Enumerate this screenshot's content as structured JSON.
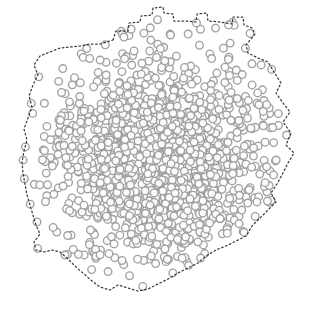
{
  "figure": {
    "title": "",
    "width": 315,
    "height": 314,
    "background_color": "#ffffff",
    "alt_text": "Dense cloud of small gray-outlined circle markers enclosed by a dark dashed jagged boundary outline"
  },
  "chart_data": {
    "type": "scatter",
    "title": "",
    "subtitle": "",
    "xlabel": "",
    "ylabel": "",
    "xlim": [
      0,
      315
    ],
    "ylim": [
      0,
      314
    ],
    "grid": false,
    "legend": null,
    "axes_visible": false,
    "tick_labels_x": [],
    "tick_labels_y": [],
    "annotations": [],
    "series": [
      {
        "name": "points",
        "marker": "circle-open",
        "marker_size_px": 7.6,
        "marker_edge_color": "#9c9c9c",
        "marker_edge_width_px": 1.35,
        "marker_face_color": "#fdfdfd",
        "marker_opacity": 0.95,
        "point_count": 1340,
        "distribution": "gaussian-radial",
        "center_x": 160,
        "center_y": 158,
        "sigma_x": 56,
        "sigma_y": 54,
        "random_seed": 20240517
      }
    ],
    "boundary": {
      "name": "concave-hull",
      "style": "dotted",
      "color": "#3b3b3b",
      "line_width_px": 1.25,
      "dash_pattern": [
        1.6,
        2.6
      ],
      "closed": true,
      "vertex_count": 58,
      "vertices": [
        [
          113,
          40
        ],
        [
          116,
          31
        ],
        [
          128,
          31
        ],
        [
          129,
          23
        ],
        [
          140,
          22
        ],
        [
          141,
          16
        ],
        [
          152,
          15
        ],
        [
          153,
          8
        ],
        [
          163,
          7
        ],
        [
          164,
          13
        ],
        [
          173,
          14
        ],
        [
          174,
          21
        ],
        [
          186,
          21
        ],
        [
          196,
          22
        ],
        [
          197,
          14
        ],
        [
          207,
          13
        ],
        [
          208,
          21
        ],
        [
          220,
          22
        ],
        [
          232,
          24
        ],
        [
          233,
          17
        ],
        [
          243,
          17
        ],
        [
          244,
          25
        ],
        [
          252,
          28
        ],
        [
          255,
          34
        ],
        [
          246,
          45
        ],
        [
          248,
          53
        ],
        [
          258,
          58
        ],
        [
          268,
          62
        ],
        [
          274,
          72
        ],
        [
          281,
          83
        ],
        [
          276,
          93
        ],
        [
          283,
          103
        ],
        [
          290,
          112
        ],
        [
          283,
          122
        ],
        [
          291,
          133
        ],
        [
          286,
          145
        ],
        [
          294,
          153
        ],
        [
          288,
          163
        ],
        [
          283,
          173
        ],
        [
          277,
          184
        ],
        [
          271,
          193
        ],
        [
          276,
          202
        ],
        [
          268,
          210
        ],
        [
          260,
          218
        ],
        [
          252,
          226
        ],
        [
          246,
          236
        ],
        [
          236,
          241
        ],
        [
          226,
          246
        ],
        [
          216,
          250
        ],
        [
          206,
          256
        ],
        [
          198,
          263
        ],
        [
          188,
          268
        ],
        [
          178,
          273
        ],
        [
          168,
          279
        ],
        [
          158,
          284
        ],
        [
          148,
          289
        ],
        [
          138,
          291
        ],
        [
          128,
          288
        ],
        [
          118,
          285
        ],
        [
          110,
          290
        ],
        [
          100,
          287
        ],
        [
          92,
          281
        ],
        [
          84,
          274
        ],
        [
          76,
          267
        ],
        [
          68,
          259
        ],
        [
          60,
          252
        ],
        [
          52,
          250
        ],
        [
          44,
          252
        ],
        [
          36,
          250
        ],
        [
          34,
          242
        ],
        [
          40,
          234
        ],
        [
          36,
          225
        ],
        [
          33,
          215
        ],
        [
          30,
          205
        ],
        [
          27,
          195
        ],
        [
          25,
          184
        ],
        [
          23,
          173
        ],
        [
          22,
          162
        ],
        [
          24,
          151
        ],
        [
          27,
          140
        ],
        [
          24,
          129
        ],
        [
          28,
          118
        ],
        [
          32,
          107
        ],
        [
          29,
          96
        ],
        [
          33,
          85
        ],
        [
          38,
          75
        ],
        [
          34,
          65
        ],
        [
          40,
          56
        ],
        [
          50,
          52
        ],
        [
          60,
          48
        ],
        [
          70,
          47
        ],
        [
          80,
          46
        ],
        [
          90,
          44
        ],
        [
          100,
          44
        ]
      ]
    }
  },
  "labels": {
    "figure_caption": "",
    "point_layer_name": "point-cloud-layer",
    "boundary_layer_name": "boundary-hull-layer"
  }
}
